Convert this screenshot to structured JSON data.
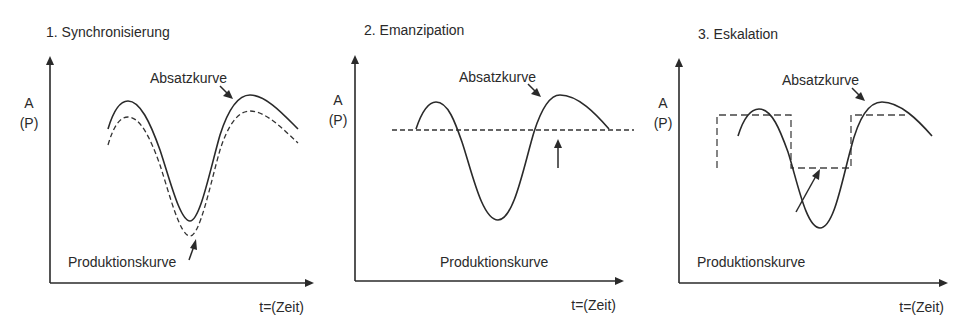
{
  "panels": [
    {
      "title": "1. Synchronisierung",
      "y_label_top": "A",
      "y_label_bottom": "(P)",
      "x_label": "t=(Zeit)",
      "absatz_label": "Absatzkurve",
      "produktion_label": "Produktionskurve"
    },
    {
      "title": "2. Emanzipation",
      "y_label_top": "A",
      "y_label_bottom": "(P)",
      "x_label": "t=(Zeit)",
      "absatz_label": "Absatzkurve",
      "produktion_label": "Produktionskurve"
    },
    {
      "title": "3. Eskalation",
      "y_label_top": "A",
      "y_label_bottom": "(P)",
      "x_label": "t=(Zeit)",
      "absatz_label": "Absatzkurve",
      "produktion_label": "Produktionskurve"
    }
  ],
  "colors": {
    "line": "#2a2a2a",
    "background": "#ffffff"
  }
}
